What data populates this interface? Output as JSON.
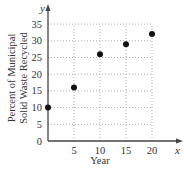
{
  "chart_data": {
    "type": "scatter",
    "title": "",
    "xlabel": "Year",
    "ylabel": "Percent of Municipal Solid Waste Recycled",
    "ylabel_lines": [
      "Percent of Municipal",
      "Solid Waste Recycled"
    ],
    "x_axis_var": "x",
    "y_axis_var": "y",
    "x": [
      0,
      5,
      10,
      15,
      20
    ],
    "y": [
      10,
      16,
      26,
      29,
      32
    ],
    "xticks": [
      5,
      10,
      15,
      20
    ],
    "yticks": [
      0,
      5,
      10,
      15,
      20,
      25,
      30,
      35
    ],
    "xlim": [
      0,
      22
    ],
    "ylim": [
      0,
      38
    ],
    "grid": true,
    "grid_style": "dotted",
    "legend": null,
    "point_color": "#111111",
    "axis_color": "#444444",
    "grid_color": "#999999"
  }
}
